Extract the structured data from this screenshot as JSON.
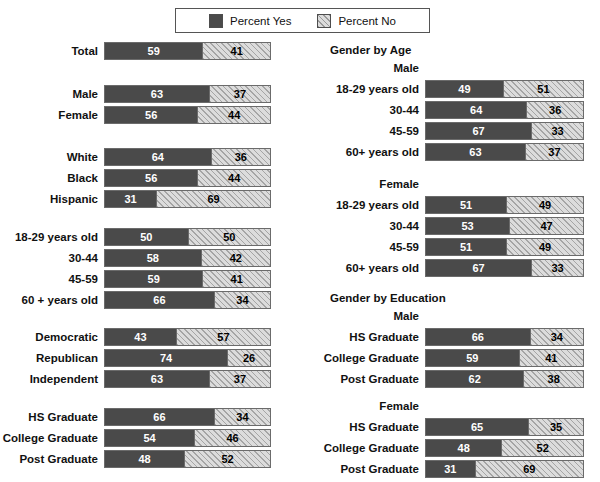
{
  "legend": {
    "entries": [
      {
        "label": "Percent Yes",
        "swatch": "solid-dark-swatch",
        "color": "#4a4a4a"
      },
      {
        "label": "Percent No",
        "swatch": "hatched-light-swatch",
        "color": "#dcdcdc"
      }
    ]
  },
  "chart_data": {
    "type": "bar",
    "orientation": "horizontal",
    "stacked": true,
    "title": "",
    "xlabel": "",
    "ylabel": "",
    "xlim": [
      0,
      100
    ],
    "grid": false,
    "legend_position": "top-center",
    "series": [
      {
        "name": "Percent Yes",
        "color": "#4a4a4a"
      },
      {
        "name": "Percent No",
        "color": "#dcdcdc"
      }
    ],
    "groups": [
      {
        "heading": "",
        "column": "left",
        "rows": [
          {
            "label": "Total",
            "yes": 59,
            "no": 41
          }
        ]
      },
      {
        "heading": "",
        "column": "left",
        "rows": [
          {
            "label": "Male",
            "yes": 63,
            "no": 37
          },
          {
            "label": "Female",
            "yes": 56,
            "no": 44
          }
        ]
      },
      {
        "heading": "",
        "column": "left",
        "rows": [
          {
            "label": "White",
            "yes": 64,
            "no": 36
          },
          {
            "label": "Black",
            "yes": 56,
            "no": 44
          },
          {
            "label": "Hispanic",
            "yes": 31,
            "no": 69
          }
        ]
      },
      {
        "heading": "",
        "column": "left",
        "rows": [
          {
            "label": "18-29 years old",
            "yes": 50,
            "no": 50
          },
          {
            "label": "30-44",
            "yes": 58,
            "no": 42
          },
          {
            "label": "45-59",
            "yes": 59,
            "no": 41
          },
          {
            "label": "60 + years old",
            "yes": 66,
            "no": 34
          }
        ]
      },
      {
        "heading": "",
        "column": "left",
        "rows": [
          {
            "label": "Democratic",
            "yes": 43,
            "no": 57
          },
          {
            "label": "Republican",
            "yes": 74,
            "no": 26
          },
          {
            "label": "Independent",
            "yes": 63,
            "no": 37
          }
        ]
      },
      {
        "heading": "",
        "column": "left",
        "rows": [
          {
            "label": "HS Graduate",
            "yes": 66,
            "no": 34
          },
          {
            "label": "College Graduate",
            "yes": 54,
            "no": 46
          },
          {
            "label": "Post Graduate",
            "yes": 48,
            "no": 52
          }
        ]
      },
      {
        "heading": "Gender by Age",
        "subheading": "Male",
        "column": "right",
        "rows": [
          {
            "label": "18-29 years old",
            "yes": 49,
            "no": 51
          },
          {
            "label": "30-44",
            "yes": 64,
            "no": 36
          },
          {
            "label": "45-59",
            "yes": 67,
            "no": 33
          },
          {
            "label": "60+ years old",
            "yes": 63,
            "no": 37
          }
        ]
      },
      {
        "heading": "",
        "subheading": "Female",
        "column": "right",
        "rows": [
          {
            "label": "18-29 years old",
            "yes": 51,
            "no": 49
          },
          {
            "label": "30-44",
            "yes": 53,
            "no": 47
          },
          {
            "label": "45-59",
            "yes": 51,
            "no": 49
          },
          {
            "label": "60+ years old",
            "yes": 67,
            "no": 33
          }
        ]
      },
      {
        "heading": "Gender by Education",
        "subheading": "Male",
        "column": "right",
        "rows": [
          {
            "label": "HS Graduate",
            "yes": 66,
            "no": 34
          },
          {
            "label": "College Graduate",
            "yes": 59,
            "no": 41
          },
          {
            "label": "Post Graduate",
            "yes": 62,
            "no": 38
          }
        ]
      },
      {
        "heading": "",
        "subheading": "Female",
        "column": "right",
        "rows": [
          {
            "label": "HS Graduate",
            "yes": 65,
            "no": 35
          },
          {
            "label": "College Graduate",
            "yes": 48,
            "no": 52
          },
          {
            "label": "Post Graduate",
            "yes": 31,
            "no": 69
          }
        ]
      }
    ]
  },
  "layout": {
    "left": {
      "label_right_edge": 104,
      "bar_left": 105,
      "bar_width": 167,
      "group_tops": [
        42,
        85,
        148,
        228,
        328,
        408
      ]
    },
    "right": {
      "heading_left": 330,
      "subheading_right_edge": 425,
      "label_right_edge": 425,
      "bar_left": 427,
      "bar_width": 159,
      "heading_tops": [
        44,
        292
      ],
      "subheading_tops": [
        62,
        178,
        310,
        400
      ],
      "group_tops": [
        80,
        196,
        328,
        418
      ]
    },
    "row_pitch": 21
  }
}
